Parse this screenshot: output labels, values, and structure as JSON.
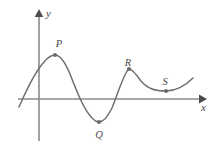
{
  "figure": {
    "type": "cartesian-graph",
    "title": "",
    "background_color": "#ffffff",
    "curve_color": "#6e6e6e",
    "axis_color": "#8a8a8a",
    "label_color": "#4a4a4a",
    "point_color": "#6b6b6b"
  },
  "axes": {
    "x_label": "x",
    "y_label": "y",
    "x_axis": {
      "start_px": [
        18,
        99
      ],
      "end_px": [
        205,
        99
      ],
      "arrow": "right"
    },
    "y_axis": {
      "start_px": [
        39,
        141
      ],
      "end_px": [
        39,
        10
      ],
      "arrow": "up"
    },
    "origin_px": [
      39,
      99
    ],
    "ticks": [],
    "grid": false
  },
  "points": [
    {
      "id": "P",
      "label": "P",
      "role": "local-maximum",
      "point_px": [
        55,
        55
      ],
      "label_px": [
        57,
        47
      ]
    },
    {
      "id": "Q",
      "label": "Q",
      "role": "local-minimum",
      "point_px": [
        99,
        122
      ],
      "label_px": [
        97,
        138
      ]
    },
    {
      "id": "R",
      "label": "R",
      "role": "local-maximum",
      "point_px": [
        129,
        69
      ],
      "label_px": [
        126,
        66
      ]
    },
    {
      "id": "S",
      "label": "S",
      "role": "local-minimum",
      "point_px": [
        166,
        91
      ],
      "label_px": [
        163,
        85
      ]
    }
  ],
  "curve": {
    "description": "smooth wavy curve with two local maxima (P, R) and two local minima (Q, S)",
    "start_px": [
      19,
      107
    ],
    "end_px": [
      193,
      78
    ],
    "path": "M 19,107 C 24,96 33,74 44,62 C 49,56 52,55 55,55 C 60,55 65,62 70,74 C 77,92 84,110 92,118 C 95,121 97,122 99,122 C 103,122 107,118 112,108 C 117,96 121,82 126,73 C 127,71 128,69 129,69 C 132,69 136,74 141,81 C 148,89 155,91 166,91 C 176,91 186,85 193,78",
    "x_intercepts_px": [
      25,
      84,
      118
    ],
    "y_intercept_px": 66
  },
  "figure_size": {
    "width": 220,
    "height": 148
  }
}
